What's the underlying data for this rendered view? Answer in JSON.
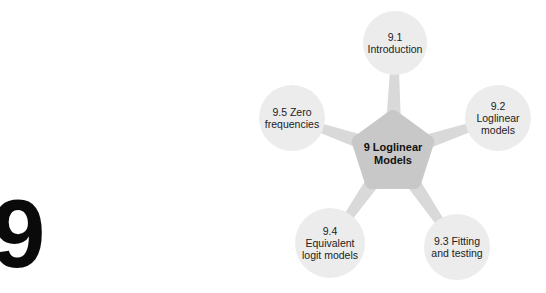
{
  "chapter": {
    "number": "9"
  },
  "colors": {
    "center_fill": "#c8c8c8",
    "node_fill": "#ececec",
    "connector": "#d9d9d9",
    "text": "#222222"
  },
  "diagram": {
    "center": {
      "lines": [
        "9 Loglinear",
        "Models"
      ]
    },
    "nodes": [
      {
        "id": "9.1",
        "lines": [
          "9.1",
          "Introduction"
        ]
      },
      {
        "id": "9.2",
        "lines": [
          "9.2",
          "Loglinear",
          "models"
        ]
      },
      {
        "id": "9.3",
        "lines": [
          "9.3 Fitting",
          "and testing"
        ]
      },
      {
        "id": "9.4",
        "lines": [
          "9.4",
          "Equivalent",
          "logit models"
        ]
      },
      {
        "id": "9.5",
        "lines": [
          "9.5 Zero",
          "frequencies"
        ]
      }
    ]
  }
}
